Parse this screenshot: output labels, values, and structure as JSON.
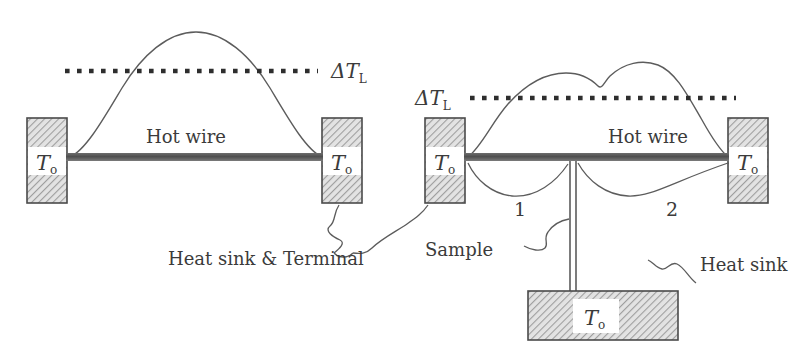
{
  "figure": {
    "background_color": "#ffffff",
    "line_color": "#4a4a4a",
    "text_color": "#3b3b3b",
    "wire_color": "#5a5a5a",
    "hatch_color": "#9a9a9a",
    "dotted_color": "#2e2e2e"
  },
  "panel_left": {
    "name": "hot wire without sample",
    "delta_label": {
      "delta": "Δ",
      "t": "T",
      "sub": "L",
      "full": "ΔT_L"
    },
    "wire_label": "Hot wire",
    "left_block_label": {
      "t": "T",
      "sub": "o",
      "full": "T_o"
    },
    "right_block_label": {
      "t": "T",
      "sub": "o",
      "full": "T_o"
    },
    "callout": "Heat sink & Terminal"
  },
  "panel_right": {
    "name": "hot wire with sample",
    "delta_label": {
      "delta": "Δ",
      "t": "T",
      "sub": "L",
      "full": "ΔT_L"
    },
    "wire_label": "Hot wire",
    "left_block_label": {
      "t": "T",
      "sub": "o",
      "full": "T_o"
    },
    "right_block_label": {
      "t": "T",
      "sub": "o",
      "full": "T_o"
    },
    "region_labels": {
      "one": "1",
      "two": "2"
    },
    "sample_callout": "Sample",
    "heat_sink_callout": "Heat sink",
    "bottom_block_label": {
      "t": "T",
      "sub": "o",
      "full": "T_o"
    }
  }
}
